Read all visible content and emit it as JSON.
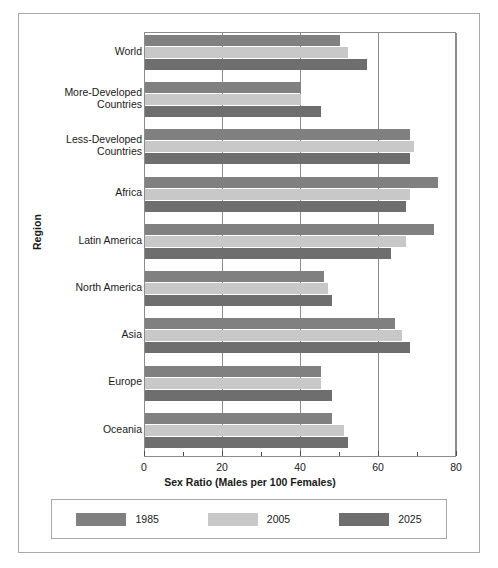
{
  "chart_data": {
    "type": "bar",
    "orientation": "horizontal",
    "title": "",
    "xlabel": "Sex Ratio (Males per 100 Females)",
    "ylabel": "Region",
    "xlim": [
      0,
      80
    ],
    "xticks": [
      0,
      20,
      40,
      60,
      80
    ],
    "xtick_labels": [
      "0",
      "20",
      "40",
      "60",
      "80"
    ],
    "xticks_minor": [
      10,
      30,
      50,
      70
    ],
    "grid": true,
    "legend_position": "bottom",
    "categories": [
      "World",
      "More-Developed Countries",
      "Less-Developed Countries",
      "Africa",
      "Latin America",
      "North America",
      "Asia",
      "Europe",
      "Oceania"
    ],
    "series": [
      {
        "name": "1985",
        "color": "#808080",
        "values": [
          50,
          40,
          68,
          75,
          74,
          46,
          64,
          45,
          48
        ]
      },
      {
        "name": "2005",
        "color": "#c8c8c8",
        "values": [
          52,
          40,
          69,
          68,
          67,
          47,
          66,
          45,
          51
        ]
      },
      {
        "name": "2025",
        "color": "#6e6e6e",
        "values": [
          57,
          45,
          68,
          67,
          63,
          48,
          68,
          48,
          52
        ]
      }
    ]
  },
  "legend": {
    "items": [
      {
        "label": "1985"
      },
      {
        "label": "2005"
      },
      {
        "label": "2025"
      }
    ]
  },
  "axes": {
    "x_title": "Sex Ratio (Males per 100 Females)",
    "y_title": "Region"
  }
}
